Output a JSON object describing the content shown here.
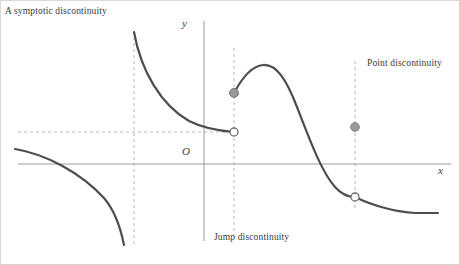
{
  "figure": {
    "width": 460,
    "height": 265,
    "background": "#ffffff",
    "border_color": "#d8d8d8"
  },
  "axes": {
    "y_label": "y",
    "origin_label": "O",
    "x_label": "x",
    "axis_color": "#9a9a9a",
    "x_axis_y": 163,
    "y_axis_x": 203,
    "x_axis_from": 17,
    "x_axis_to": 450,
    "y_axis_from": 20,
    "y_axis_to": 240
  },
  "annotations": {
    "asymptotic": "A symptotic discontinuity",
    "jump": "Jump discontinuity",
    "point": "Point discontinuity",
    "text_color": "#3a3a3a"
  },
  "guides": {
    "color": "#b8b8b8",
    "dash": "3,3",
    "vertical": [
      {
        "name": "asymptote-guide",
        "x": 133,
        "y1": 30,
        "y2": 245
      },
      {
        "name": "jump-guide",
        "x": 233,
        "y1": 47,
        "y2": 238
      },
      {
        "name": "point-guide",
        "x": 354,
        "y1": 60,
        "y2": 210
      }
    ],
    "horizontal": [
      {
        "name": "limit-guide",
        "y": 131,
        "x1": 17,
        "x2": 236
      }
    ]
  },
  "chart_data": {
    "type": "line",
    "xlabel": "x",
    "ylabel": "y",
    "grid": false,
    "legend": "none",
    "curve_color": "#4d4d4d",
    "curve_width": 2.2,
    "annotations": [
      {
        "text": "A symptotic discontinuity",
        "x": 4,
        "y": 12
      },
      {
        "text": "Jump discontinuity",
        "x": 213,
        "y": 240
      },
      {
        "text": "Point discontinuity",
        "x": 366,
        "y": 67
      }
    ],
    "series": [
      {
        "name": "asymptotic-upper-branch",
        "path": "M133,31 C140,70 160,104 188,120 C204,128 220,130 233,131",
        "note": "Upper-right hyperbolic arm approaching vertical asymptote x=133 and horizontal limit y=131"
      },
      {
        "name": "asymptotic-lower-branch",
        "path": "M14,148 C45,153 80,172 103,197 C115,211 120,229 123,244",
        "note": "Lower-left arm falling to negative infinity at asymptote x=133"
      },
      {
        "name": "main-s-curve",
        "path": "M233,92 C241,77 251,65 262,64 C276,63 286,80 296,106 C308,137 320,170 334,186 C341,194 348,196 354,196",
        "note": "Rises to local maximum near (261,64), then descends through the x-axis to the point discontinuity"
      },
      {
        "name": "right-tail",
        "path": "M354,196 C372,205 396,211 414,212 C424,212 432,212 437,212",
        "note": "Continues right of the removable discontinuity, flattening near y=212"
      }
    ],
    "markers": [
      {
        "name": "jump-filled-point",
        "kind": "filled",
        "x": 233,
        "y": 92,
        "fill": "#9a9a9a",
        "stroke": "#6e6e6e",
        "r": 4.4
      },
      {
        "name": "jump-open-point",
        "kind": "open",
        "x": 233,
        "y": 131,
        "fill": "#ffffff",
        "stroke": "#6e6e6e",
        "r": 4.0
      },
      {
        "name": "point-filled-point",
        "kind": "filled",
        "x": 354,
        "y": 126,
        "fill": "#9a9a9a",
        "stroke": "#8a8a8a",
        "r": 4.4
      },
      {
        "name": "point-open-point",
        "kind": "open",
        "x": 354,
        "y": 196,
        "fill": "#ffffff",
        "stroke": "#6e6e6e",
        "r": 4.0
      }
    ],
    "x": [
      133,
      233,
      354
    ],
    "values": [
      null,
      null,
      null
    ]
  }
}
